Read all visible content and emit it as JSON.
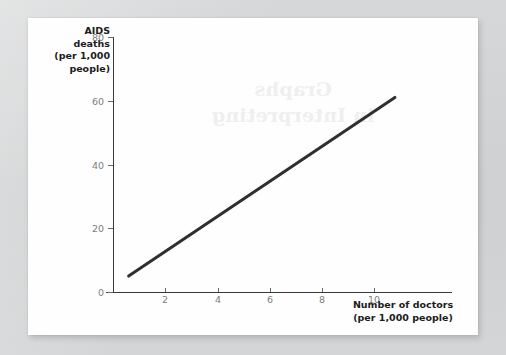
{
  "figure": {
    "background_color": "#d2d3d4",
    "card_color": "#fefefe",
    "line_color": "#2f2f2f",
    "axis_color": "#3a3a3a",
    "tick_label_color": "#7d7d7d",
    "ghost_text": "Graphs\nin Interpreting"
  },
  "chart_data": {
    "type": "line",
    "title": "",
    "subtitle": "",
    "xlabel": "Number of doctors\n(per 1,000 people)",
    "ylabel": "AIDS\ndeaths\n(per 1,000\npeople)",
    "xlim": [
      0,
      11.6
    ],
    "ylim": [
      0,
      88
    ],
    "xticks": [
      2,
      4,
      6,
      8,
      10
    ],
    "xtick_labels": [
      "2",
      "4",
      "6",
      "8",
      "10"
    ],
    "yticks": [
      0,
      20,
      40,
      60,
      80
    ],
    "ytick_labels": [
      "0",
      "20",
      "40",
      "60",
      "80"
    ],
    "grid": false,
    "legend": false,
    "series": [
      {
        "name": "AIDS deaths vs doctors",
        "x": [
          0.6,
          10.8
        ],
        "y": [
          5,
          61
        ],
        "line_width": 3,
        "color": "#2f2f2f",
        "style": "solid"
      }
    ],
    "annotations": []
  }
}
